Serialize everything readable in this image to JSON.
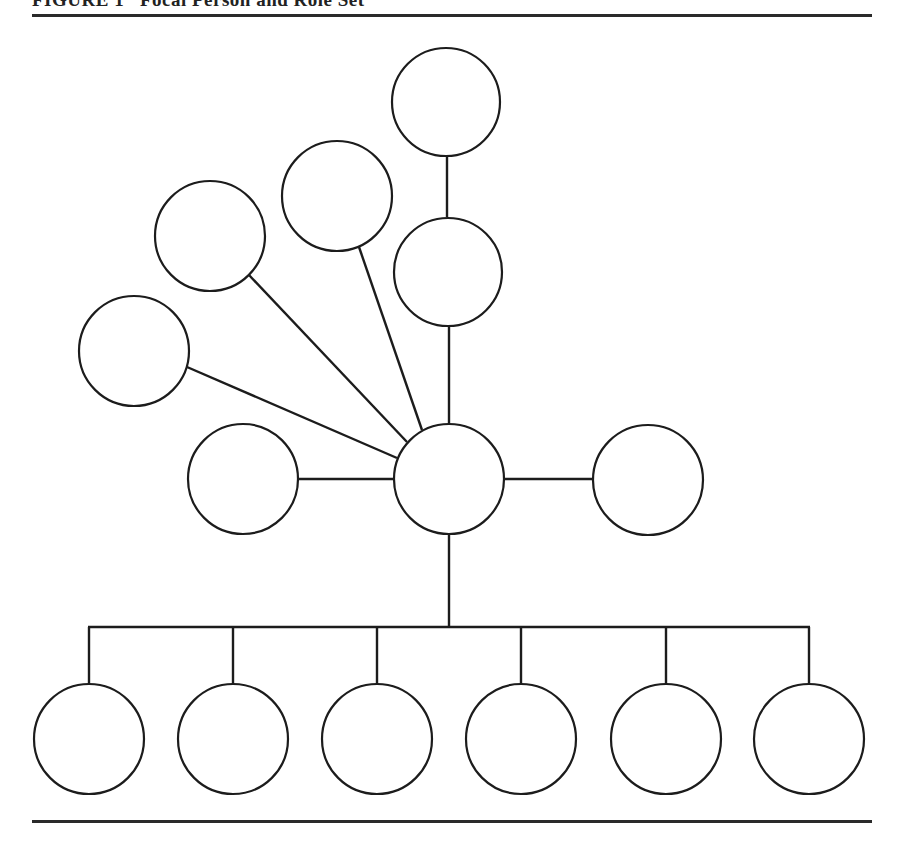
{
  "figure": {
    "title": "FIGURE 1   Focal Person and Role Set",
    "node_radius": 55,
    "stroke_color": "#1c1c1c",
    "focal_person": {
      "id": "focal",
      "cx": 449,
      "cy": 479
    },
    "role_senders_upper": [
      {
        "id": "top-chain-upper",
        "cx": 446,
        "cy": 102
      },
      {
        "id": "top-chain-lower",
        "cx": 448,
        "cy": 272
      },
      {
        "id": "fan-1",
        "cx": 337,
        "cy": 196
      },
      {
        "id": "fan-2",
        "cx": 210,
        "cy": 236
      },
      {
        "id": "fan-3",
        "cx": 134,
        "cy": 351
      },
      {
        "id": "left",
        "cx": 243,
        "cy": 479
      },
      {
        "id": "right",
        "cx": 648,
        "cy": 480
      }
    ],
    "role_senders_lower": [
      {
        "id": "bottom-1",
        "cx": 89,
        "cy": 739
      },
      {
        "id": "bottom-2",
        "cx": 233,
        "cy": 739
      },
      {
        "id": "bottom-3",
        "cx": 377,
        "cy": 739
      },
      {
        "id": "bottom-4",
        "cx": 521,
        "cy": 739
      },
      {
        "id": "bottom-5",
        "cx": 666,
        "cy": 739
      },
      {
        "id": "bottom-6",
        "cx": 809,
        "cy": 739
      }
    ],
    "bus": {
      "y": 627,
      "x1": 89,
      "x2": 809
    }
  }
}
